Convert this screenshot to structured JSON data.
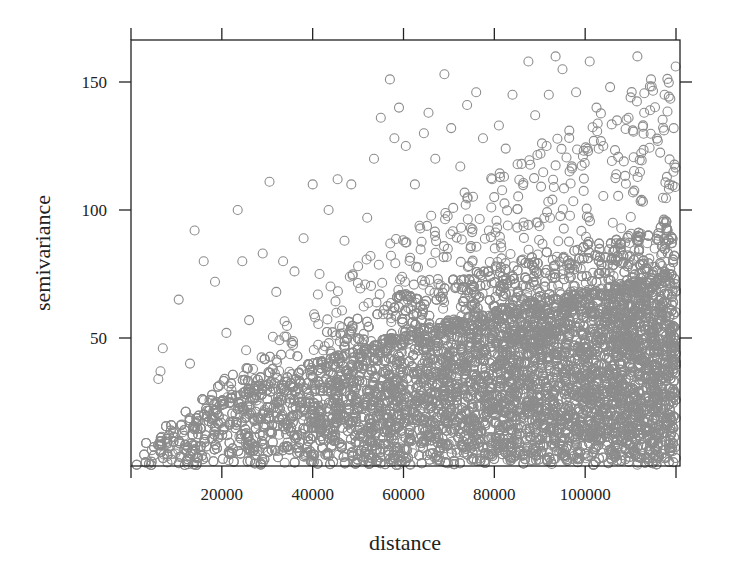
{
  "chart_data": {
    "type": "scatter",
    "title": "",
    "xlabel": "distance",
    "ylabel": "semivariance",
    "xlim": [
      0,
      120000
    ],
    "ylim": [
      0,
      165
    ],
    "x_ticks": [
      20000,
      40000,
      60000,
      80000,
      100000
    ],
    "x_tick_labels": [
      "20000",
      "40000",
      "60000",
      "80000",
      "100000"
    ],
    "x_ticks_unlabeled": [
      0,
      120000
    ],
    "y_ticks": [
      50,
      100,
      150
    ],
    "y_tick_labels": [
      "50",
      "100",
      "150"
    ],
    "grid": false,
    "legend": null,
    "marker": {
      "shape": "open-circle",
      "radius_px": 4.5,
      "color": "#8c8c8c"
    },
    "dense_cloud": {
      "description": "very dense cloud of points; upper envelope rises roughly linearly with distance",
      "envelope": [
        {
          "x": 0,
          "y": 3
        },
        {
          "x": 10000,
          "y": 15
        },
        {
          "x": 20000,
          "y": 25
        },
        {
          "x": 40000,
          "y": 38
        },
        {
          "x": 60000,
          "y": 50
        },
        {
          "x": 80000,
          "y": 58
        },
        {
          "x": 100000,
          "y": 65
        },
        {
          "x": 120000,
          "y": 72
        }
      ],
      "count": 9000
    },
    "outliers": [
      {
        "x": 7000,
        "y": 46
      },
      {
        "x": 6500,
        "y": 37
      },
      {
        "x": 6000,
        "y": 34
      },
      {
        "x": 10500,
        "y": 65
      },
      {
        "x": 14000,
        "y": 92
      },
      {
        "x": 16000,
        "y": 80
      },
      {
        "x": 13000,
        "y": 40
      },
      {
        "x": 18500,
        "y": 72
      },
      {
        "x": 21000,
        "y": 52
      },
      {
        "x": 23500,
        "y": 100
      },
      {
        "x": 24500,
        "y": 80
      },
      {
        "x": 26000,
        "y": 57
      },
      {
        "x": 29000,
        "y": 83
      },
      {
        "x": 30500,
        "y": 111
      },
      {
        "x": 32000,
        "y": 68
      },
      {
        "x": 33500,
        "y": 80
      },
      {
        "x": 36000,
        "y": 76
      },
      {
        "x": 38000,
        "y": 89
      },
      {
        "x": 40000,
        "y": 110
      },
      {
        "x": 41500,
        "y": 75
      },
      {
        "x": 43500,
        "y": 100
      },
      {
        "x": 45500,
        "y": 112
      },
      {
        "x": 47000,
        "y": 88
      },
      {
        "x": 48500,
        "y": 110
      },
      {
        "x": 50000,
        "y": 78
      },
      {
        "x": 52000,
        "y": 97
      },
      {
        "x": 53500,
        "y": 120
      },
      {
        "x": 55000,
        "y": 136
      },
      {
        "x": 57000,
        "y": 151
      },
      {
        "x": 58000,
        "y": 128
      },
      {
        "x": 59000,
        "y": 140
      },
      {
        "x": 60500,
        "y": 125
      },
      {
        "x": 62500,
        "y": 110
      },
      {
        "x": 64500,
        "y": 130
      },
      {
        "x": 65500,
        "y": 138
      },
      {
        "x": 67000,
        "y": 120
      },
      {
        "x": 69000,
        "y": 153
      },
      {
        "x": 70500,
        "y": 132
      },
      {
        "x": 72500,
        "y": 117
      },
      {
        "x": 74000,
        "y": 141
      },
      {
        "x": 76000,
        "y": 146
      },
      {
        "x": 77500,
        "y": 128
      },
      {
        "x": 79500,
        "y": 112
      },
      {
        "x": 81000,
        "y": 133
      },
      {
        "x": 82500,
        "y": 124
      },
      {
        "x": 84000,
        "y": 145
      },
      {
        "x": 86000,
        "y": 118
      },
      {
        "x": 87500,
        "y": 158
      },
      {
        "x": 89000,
        "y": 137
      },
      {
        "x": 90500,
        "y": 126
      },
      {
        "x": 92000,
        "y": 145
      },
      {
        "x": 93500,
        "y": 160
      },
      {
        "x": 95000,
        "y": 155
      },
      {
        "x": 96500,
        "y": 131
      },
      {
        "x": 98000,
        "y": 146
      },
      {
        "x": 99500,
        "y": 121
      },
      {
        "x": 101000,
        "y": 158
      },
      {
        "x": 102500,
        "y": 140
      },
      {
        "x": 104000,
        "y": 125
      },
      {
        "x": 105500,
        "y": 148
      },
      {
        "x": 107000,
        "y": 135
      },
      {
        "x": 108500,
        "y": 119
      },
      {
        "x": 110000,
        "y": 144
      },
      {
        "x": 111500,
        "y": 160
      },
      {
        "x": 113000,
        "y": 138
      },
      {
        "x": 114500,
        "y": 151
      },
      {
        "x": 116000,
        "y": 127
      },
      {
        "x": 117500,
        "y": 145
      },
      {
        "x": 118500,
        "y": 110
      },
      {
        "x": 119500,
        "y": 132
      }
    ]
  }
}
